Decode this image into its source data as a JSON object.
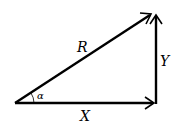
{
  "diagram": {
    "type": "vector-triangle",
    "labels": {
      "resultant": "R",
      "horizontal": "X",
      "vertical": "Y",
      "angle": "α"
    },
    "colors": {
      "stroke": "#000000",
      "background": "#ffffff"
    },
    "vectors": [
      {
        "name": "X",
        "from": [
          15,
          103
        ],
        "to": [
          154,
          103
        ]
      },
      {
        "name": "Y",
        "from": [
          155,
          103
        ],
        "to": [
          155,
          15
        ]
      },
      {
        "name": "R",
        "from": [
          15,
          103
        ],
        "to": [
          152,
          14
        ]
      }
    ]
  }
}
